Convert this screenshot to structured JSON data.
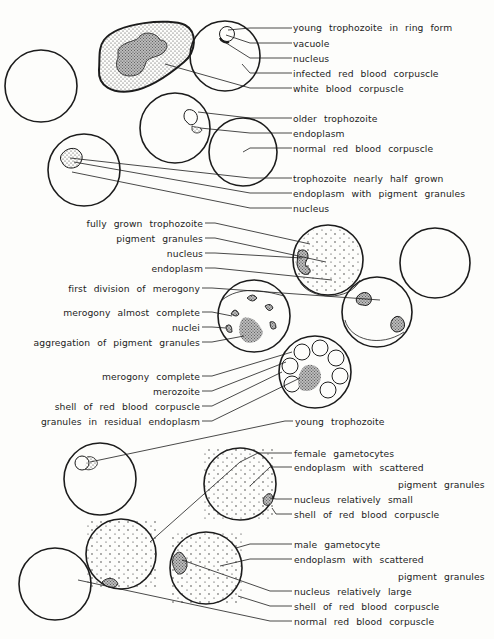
{
  "figure": {
    "colors": {
      "ink": "#1c1c1c",
      "paper": "#fdfdfb",
      "stipple": "#888888"
    }
  },
  "labels_right_top": [
    {
      "id": "young-trophozoite-ring",
      "text": "young  trophozoite  in  ring  form",
      "x": 293,
      "y": 22
    },
    {
      "id": "vacuole",
      "text": "vacuole",
      "x": 293,
      "y": 38
    },
    {
      "id": "nucleus-1",
      "text": "nucleus",
      "x": 293,
      "y": 53
    },
    {
      "id": "infected-rbc",
      "text": "infected  red  blood  corpuscle",
      "x": 293,
      "y": 68
    },
    {
      "id": "wbc",
      "text": "white  blood  corpuscle",
      "x": 293,
      "y": 83
    },
    {
      "id": "older-trophozoite",
      "text": "older  trophozoite",
      "x": 293,
      "y": 113
    },
    {
      "id": "endoplasm-1",
      "text": "endoplasm",
      "x": 293,
      "y": 128
    },
    {
      "id": "normal-rbc-1",
      "text": "normal  red  blood  corpuscle",
      "x": 293,
      "y": 143
    },
    {
      "id": "trophozoite-half",
      "text": "trophozoite  nearly  half  grown",
      "x": 293,
      "y": 173
    },
    {
      "id": "endoplasm-pigment",
      "text": "endoplasm  with  pigment  granules",
      "x": 293,
      "y": 188
    },
    {
      "id": "nucleus-2",
      "text": "nucleus",
      "x": 293,
      "y": 203
    }
  ],
  "labels_left_middle": [
    {
      "id": "fully-grown-trophozoite",
      "text": "fully  grown  trophozoite",
      "right": 203,
      "y": 218
    },
    {
      "id": "pigment-granules",
      "text": "pigment  granules",
      "right": 203,
      "y": 233
    },
    {
      "id": "nucleus-3",
      "text": "nucleus",
      "right": 203,
      "y": 248
    },
    {
      "id": "endoplasm-2",
      "text": "endoplasm",
      "right": 203,
      "y": 263
    },
    {
      "id": "first-division",
      "text": "first  division  of  merogony",
      "right": 200,
      "y": 283
    },
    {
      "id": "merogony-almost",
      "text": "merogony  almost  complete",
      "right": 200,
      "y": 307
    },
    {
      "id": "nuclei",
      "text": "nuclei",
      "right": 200,
      "y": 322
    },
    {
      "id": "aggregation-pigment",
      "text": "aggregation  of  pigment  granules",
      "right": 200,
      "y": 337
    },
    {
      "id": "merogony-complete",
      "text": "merogony  complete",
      "right": 200,
      "y": 371
    },
    {
      "id": "merozoite",
      "text": "merozoite",
      "right": 200,
      "y": 386
    },
    {
      "id": "shell-rbc-1",
      "text": "shell  of  red  blood  corpuscle",
      "right": 200,
      "y": 401
    },
    {
      "id": "granules-residual",
      "text": "granules  in  residual  endoplasm",
      "right": 200,
      "y": 416
    }
  ],
  "labels_right_bottom": [
    {
      "id": "young-trophozoite",
      "text": "young  trophozoite",
      "x": 295,
      "y": 416
    },
    {
      "id": "female-gametocytes",
      "text": "female  gametocytes",
      "x": 294,
      "y": 448
    },
    {
      "id": "endoplasm-scattered-1",
      "text": "endoplasm  with  scattered",
      "x": 294,
      "y": 462
    },
    {
      "id": "pigment-granules-1",
      "text": "pigment  granules",
      "x": 398,
      "y": 479
    },
    {
      "id": "nucleus-small",
      "text": "nucleus  relatively  small",
      "x": 294,
      "y": 494
    },
    {
      "id": "shell-rbc-2",
      "text": "shell  of  red  blood  corpuscle",
      "x": 294,
      "y": 509
    },
    {
      "id": "male-gametocyte",
      "text": "male  gametocyte",
      "x": 294,
      "y": 539
    },
    {
      "id": "endoplasm-scattered-2",
      "text": "endoplasm  with  scattered",
      "x": 294,
      "y": 554
    },
    {
      "id": "pigment-granules-2",
      "text": "pigment  granules",
      "x": 398,
      "y": 571
    },
    {
      "id": "nucleus-large",
      "text": "nucleus  relatively  large",
      "x": 294,
      "y": 586
    },
    {
      "id": "shell-rbc-3",
      "text": "shell  of  red  blood  corpuscle",
      "x": 294,
      "y": 601
    },
    {
      "id": "normal-rbc-2",
      "text": "normal  red  blood  corpuscle",
      "x": 294,
      "y": 616
    }
  ]
}
